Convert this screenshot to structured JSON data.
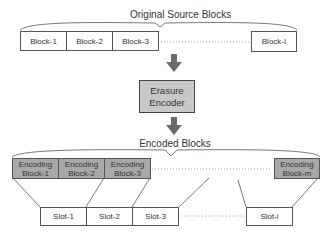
{
  "source": {
    "title": "Original Source Blocks",
    "blocks": [
      "Block-1",
      "Block-2",
      "Block-3",
      "Block-I"
    ]
  },
  "encoder": {
    "line1": "Erasure",
    "line2": "Encoder"
  },
  "encoded": {
    "title": "Encoded Blocks",
    "blocks": [
      {
        "line1": "Encoding",
        "line2": "Block-1"
      },
      {
        "line1": "Encoding",
        "line2": "Block-2"
      },
      {
        "line1": "Encoding",
        "line2": "Block-3"
      },
      {
        "line1": "Encoding",
        "line2": "Block-m"
      }
    ]
  },
  "slots": [
    "Slot-1",
    "Slot-2",
    "Slot-3",
    "Slot-i"
  ],
  "colors": {
    "encoder_fill": "#c8c8c8",
    "encoding_block_fill": "#a8a8a8",
    "arrow": "#6a6a6a"
  }
}
